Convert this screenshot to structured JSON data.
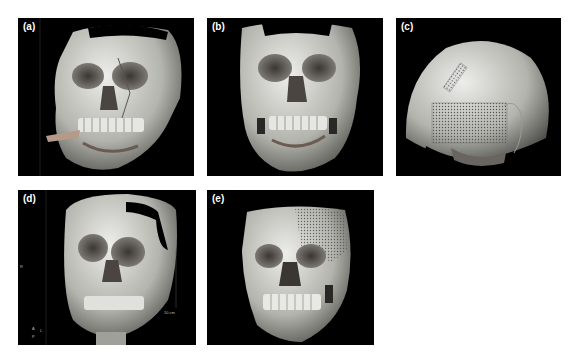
{
  "figure": {
    "panels": [
      {
        "id": "a",
        "label": "(a)",
        "view": "oblique-frontal-right",
        "description": "3D CT reconstruction of fractured skull, oblique view"
      },
      {
        "id": "b",
        "label": "(b)",
        "view": "frontal",
        "description": "3D CT reconstruction of fractured skull, frontal view"
      },
      {
        "id": "c",
        "label": "(c)",
        "view": "posterolateral",
        "description": "3D CT skull with cranial mesh plate"
      },
      {
        "id": "d",
        "label": "(d)",
        "view": "frontal-oblique",
        "description": "3D CT skull with scale bar and orientation markers",
        "annotations": {
          "scale_bar": "10 cm",
          "orientation_left": "R",
          "orientation_markers": [
            "A",
            "L",
            "P"
          ]
        }
      },
      {
        "id": "e",
        "label": "(e)",
        "view": "frontal",
        "description": "3D CT skull after repair with titanium mesh"
      }
    ]
  },
  "colors": {
    "background": "#ffffff",
    "panel_bg": "#000000",
    "bone": "#d8d8d4",
    "bone_shadow": "#6e6e6a"
  }
}
